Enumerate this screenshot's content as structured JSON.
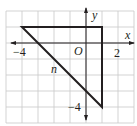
{
  "figure": {
    "type": "coordinate-plane-diagram",
    "grid": {
      "x_min": -5,
      "x_max": 3,
      "y_min": -5,
      "y_max": 2,
      "unit_px": 16,
      "origin_px": [
        86,
        43
      ]
    },
    "axes": {
      "x_label": "x",
      "y_label": "y",
      "origin_label": "O",
      "x_tick_labels": [
        {
          "value": -4,
          "text": "−4"
        },
        {
          "value": 2,
          "text": "2"
        }
      ],
      "y_tick_labels": [
        {
          "value": -4,
          "text": "−4"
        }
      ]
    },
    "triangle": {
      "vertices": [
        [
          -4,
          1
        ],
        [
          1,
          1
        ],
        [
          1,
          -4
        ]
      ],
      "hypotenuse_label": "n"
    },
    "colors": {
      "grid": "#c8c8c8",
      "axis": "#231f20",
      "shape": "#231f20",
      "background": "#ffffff"
    }
  }
}
